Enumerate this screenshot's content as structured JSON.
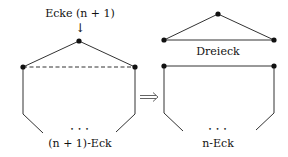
{
  "labels": {
    "vertex_label": "Ecke (n + 1)",
    "left_polygon": "(n + 1)-Eck",
    "triangle": "Dreieck",
    "right_polygon": "n-Eck",
    "ellipsis": "• • •",
    "implies": "⟹",
    "down_arrow": "↓"
  },
  "colors": {
    "stroke": "#222222",
    "background": "#ffffff"
  }
}
